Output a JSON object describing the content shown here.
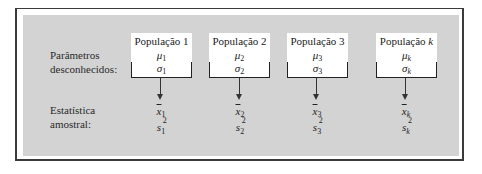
{
  "labels": {
    "parameters_line1": "Parâmetros",
    "parameters_line2": "desconhecidos:",
    "statistics_line1": "Estatística",
    "statistics_line2": "amostral:"
  },
  "populations": [
    {
      "title": "População 1",
      "mu": "μ",
      "mu_sub": "1",
      "sigma": "σ",
      "sigma_sub": "1",
      "xbar": "x",
      "xbar_sub": "1",
      "s": "s",
      "s_sup": "2",
      "s_sub": "1",
      "sub_italic": false
    },
    {
      "title": "População 2",
      "mu": "μ",
      "mu_sub": "2",
      "sigma": "σ",
      "sigma_sub": "2",
      "xbar": "x",
      "xbar_sub": "2",
      "s": "s",
      "s_sup": "2",
      "s_sub": "2",
      "sub_italic": false
    },
    {
      "title": "População 3",
      "mu": "μ",
      "mu_sub": "3",
      "sigma": "σ",
      "sigma_sub": "3",
      "xbar": "x",
      "xbar_sub": "3",
      "s": "s",
      "s_sup": "2",
      "s_sub": "3",
      "sub_italic": false
    },
    {
      "title_prefix": "População ",
      "title_k": "k",
      "mu": "μ",
      "mu_sub": "k",
      "sigma": "σ",
      "sigma_sub": "k",
      "xbar": "x",
      "xbar_sub": "k",
      "s": "s",
      "s_sup": "2",
      "s_sub": "k",
      "sub_italic": true
    }
  ],
  "colors": {
    "panel": "#d3d3d3",
    "frame": "#3a3a3a",
    "box": "#ffffff"
  }
}
